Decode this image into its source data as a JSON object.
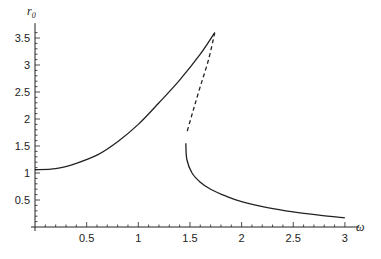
{
  "chart_data": {
    "type": "line",
    "title": "",
    "xlabel": "ω",
    "ylabel": "r0",
    "ylabel_main": "r",
    "ylabel_sub": "0",
    "xlim": [
      0,
      3.1
    ],
    "ylim": [
      0,
      3.7
    ],
    "grid": false,
    "legend": null,
    "x_ticks_major": [
      0.5,
      1,
      1.5,
      2,
      2.5,
      3
    ],
    "x_tick_labels": [
      "0.5",
      "1",
      "1.5",
      "2",
      "2.5",
      "3"
    ],
    "y_ticks_major": [
      0.5,
      1,
      1.5,
      2,
      2.5,
      3,
      3.5
    ],
    "y_tick_labels": [
      "0.5",
      "1",
      "1.5",
      "2",
      "2.5",
      "3",
      "3.5"
    ],
    "series": [
      {
        "name": "upper stable branch",
        "style": "solid",
        "points": [
          [
            0,
            1.06
          ],
          [
            0.2,
            1.08
          ],
          [
            0.4,
            1.18
          ],
          [
            0.6,
            1.33
          ],
          [
            0.8,
            1.58
          ],
          [
            1.0,
            1.9
          ],
          [
            1.2,
            2.3
          ],
          [
            1.4,
            2.72
          ],
          [
            1.6,
            3.2
          ],
          [
            1.74,
            3.6
          ]
        ]
      },
      {
        "name": "unstable branch",
        "style": "dashed",
        "points": [
          [
            1.74,
            3.6
          ],
          [
            1.68,
            3.1
          ],
          [
            1.6,
            2.6
          ],
          [
            1.53,
            2.15
          ],
          [
            1.47,
            1.75
          ]
        ]
      },
      {
        "name": "lower stable branch",
        "style": "solid",
        "points": [
          [
            1.46,
            1.55
          ],
          [
            1.47,
            1.25
          ],
          [
            1.52,
            1.0
          ],
          [
            1.6,
            0.83
          ],
          [
            1.7,
            0.7
          ],
          [
            1.85,
            0.57
          ],
          [
            2.0,
            0.47
          ],
          [
            2.25,
            0.36
          ],
          [
            2.5,
            0.28
          ],
          [
            2.75,
            0.22
          ],
          [
            3.0,
            0.17
          ]
        ]
      }
    ]
  },
  "layout": {
    "x0": 35,
    "xscale": 103.3,
    "y0": 227,
    "yscale": 54,
    "line_color": "#222222"
  }
}
